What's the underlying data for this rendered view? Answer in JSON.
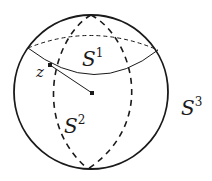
{
  "diagram": {
    "title": "",
    "labels": {
      "s1": {
        "base": "S",
        "sup": "1"
      },
      "s2": {
        "base": "S",
        "sup": "2"
      },
      "s3": {
        "base": "S",
        "sup": "3"
      },
      "z": "z"
    },
    "elements": [
      {
        "id": "sphere-outline",
        "kind": "circle",
        "style": "solid"
      },
      {
        "id": "s1-front-arc",
        "kind": "arc",
        "style": "solid"
      },
      {
        "id": "s1-back-arc",
        "kind": "arc",
        "style": "dashed"
      },
      {
        "id": "s2-left-arc",
        "kind": "arc",
        "style": "dashed"
      },
      {
        "id": "s2-right-arc",
        "kind": "arc",
        "style": "dashed"
      },
      {
        "id": "radius-segment",
        "kind": "line",
        "style": "solid",
        "from": "z",
        "to": "center"
      },
      {
        "id": "point-z",
        "kind": "point"
      },
      {
        "id": "center-point",
        "kind": "point"
      }
    ],
    "colors": {
      "stroke": "#1a1a1a",
      "background": "#ffffff"
    }
  }
}
